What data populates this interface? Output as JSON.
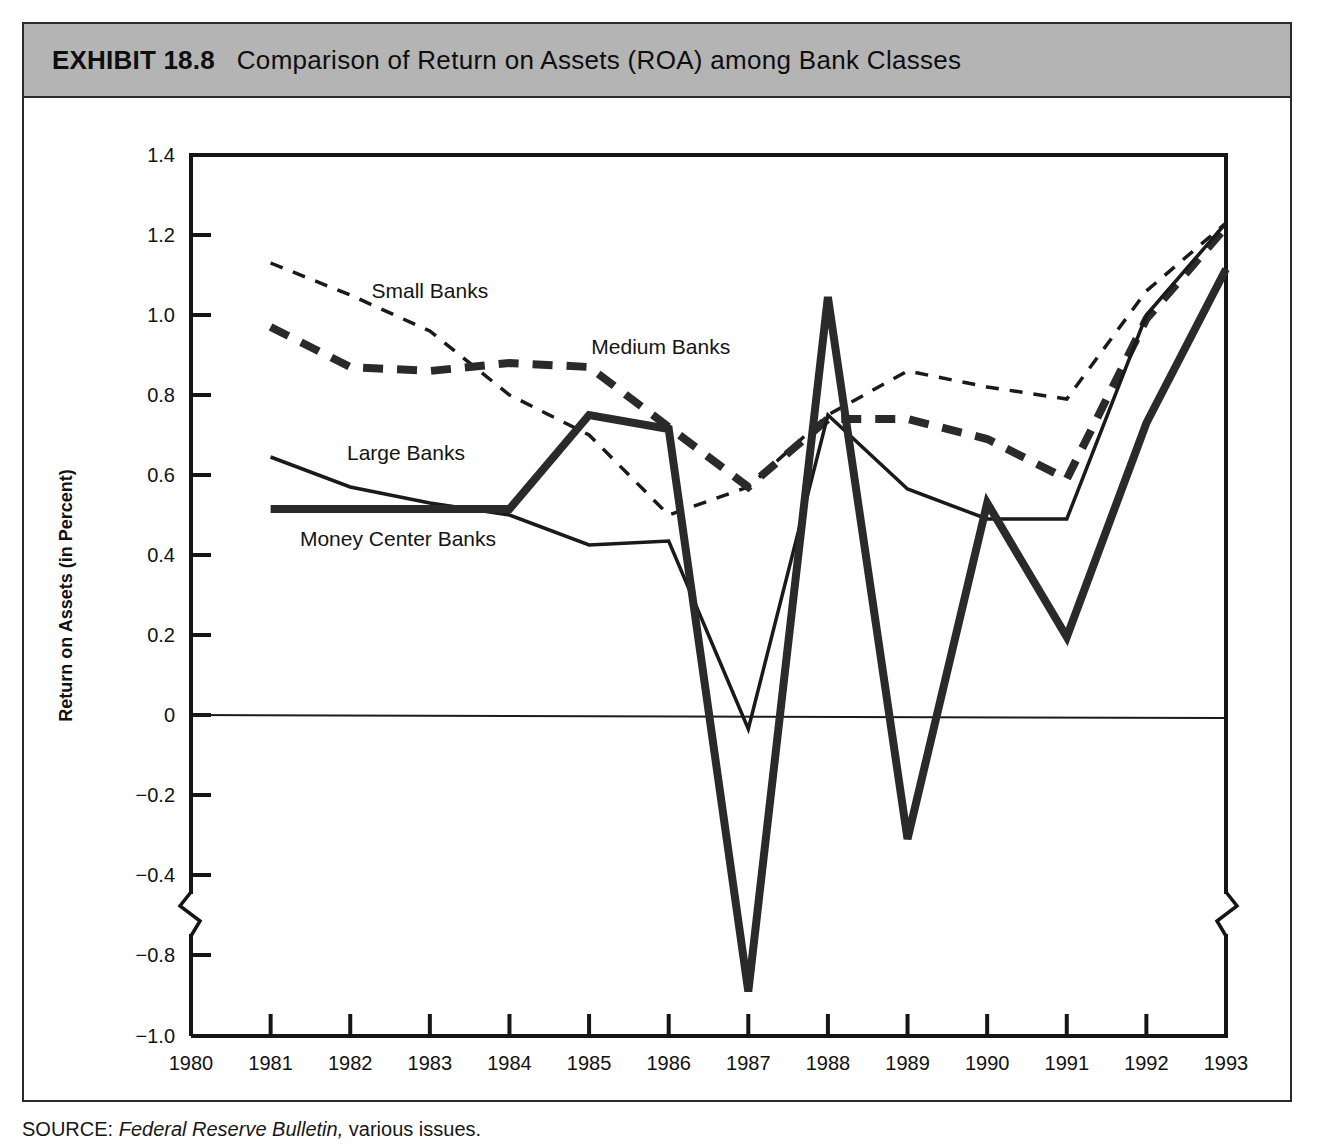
{
  "exhibit": {
    "number": "EXHIBIT 18.8",
    "title": "Comparison of Return on Assets (ROA) among Bank Classes",
    "source_lead": "SOURCE:",
    "source_italic": " Federal Reserve Bulletin,",
    "source_tail": " various issues."
  },
  "chart_data": {
    "type": "line",
    "title": "Comparison of Return on Assets (ROA) among Bank Classes",
    "xlabel": "Year",
    "ylabel": "Return on Assets (in Percent)",
    "x": [
      1980,
      1981,
      1982,
      1983,
      1984,
      1985,
      1986,
      1987,
      1988,
      1989,
      1990,
      1991,
      1992,
      1993
    ],
    "xtick_labels": [
      "1980",
      "1981",
      "1982",
      "1983",
      "1984",
      "1985",
      "1986",
      "1987",
      "1988",
      "1989",
      "1990",
      "1991",
      "1992",
      "1993"
    ],
    "ytick_labels": [
      "1.4",
      "1.2",
      "1.0",
      "0.8",
      "0.6",
      "0.4",
      "0.2",
      "0",
      "−0.2",
      "−0.4",
      "−0.8",
      "−1.0"
    ],
    "ytick_values": [
      1.4,
      1.2,
      1.0,
      0.8,
      0.6,
      0.4,
      0.2,
      0,
      -0.2,
      -0.4,
      -0.8,
      -1.0
    ],
    "ylim": [
      -1.0,
      1.4
    ],
    "xlim": [
      1980,
      1993
    ],
    "axis_break": {
      "between": [
        -0.4,
        -0.8
      ],
      "symbol": "zigzag"
    },
    "zero_line": true,
    "grid": false,
    "legend_position": "inline-annotations",
    "series": [
      {
        "name": "Small Banks",
        "style": "dashed-thin",
        "color": "#1a1a1a",
        "label_x": 1983.0,
        "label_y": 1.06,
        "x": [
          1981,
          1982,
          1983,
          1984,
          1985,
          1986,
          1987,
          1988,
          1989,
          1990,
          1991,
          1992,
          1993
        ],
        "values": [
          1.13,
          1.05,
          0.96,
          0.8,
          0.7,
          0.5,
          0.57,
          0.75,
          0.86,
          0.82,
          0.79,
          1.06,
          1.23
        ]
      },
      {
        "name": "Medium Banks",
        "style": "dashed-thick",
        "color": "#2a2a2a",
        "label_x": 1985.9,
        "label_y": 0.92,
        "x": [
          1981,
          1982,
          1983,
          1984,
          1985,
          1986,
          1987,
          1988,
          1989,
          1990,
          1991,
          1992,
          1993
        ],
        "values": [
          0.97,
          0.87,
          0.86,
          0.88,
          0.87,
          0.72,
          0.57,
          0.74,
          0.74,
          0.69,
          0.59,
          0.99,
          1.22
        ]
      },
      {
        "name": "Large Banks",
        "style": "solid-thin",
        "color": "#1a1a1a",
        "label_x": 1982.7,
        "label_y": 0.655,
        "x": [
          1981,
          1982,
          1983,
          1984,
          1985,
          1986,
          1987,
          1988,
          1989,
          1990,
          1991,
          1992,
          1993
        ],
        "values": [
          0.645,
          0.57,
          0.53,
          0.5,
          0.425,
          0.435,
          -0.035,
          0.75,
          0.565,
          0.49,
          0.49,
          1.0,
          1.23
        ]
      },
      {
        "name": "Money Center Banks",
        "style": "solid-thick",
        "color": "#2a2a2a",
        "label_x": 1982.6,
        "label_y": 0.44,
        "x": [
          1981,
          1982,
          1983,
          1984,
          1985,
          1986,
          1987,
          1988,
          1989,
          1990,
          1991,
          1992,
          1993
        ],
        "values": [
          0.515,
          0.515,
          0.515,
          0.515,
          0.75,
          0.715,
          -0.89,
          1.045,
          -0.31,
          0.53,
          0.195,
          0.73,
          1.115
        ]
      }
    ]
  }
}
